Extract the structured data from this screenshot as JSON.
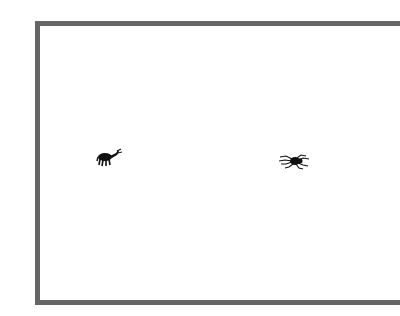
{
  "scene": {
    "frame": {
      "border_color": "#666666",
      "background": "#ffffff"
    },
    "creatures": [
      {
        "name": "ant-like insect",
        "icon": "insect-icon",
        "x": 96,
        "y": 148,
        "color": "#111111"
      },
      {
        "name": "spider",
        "icon": "spider-icon",
        "x": 279,
        "y": 153,
        "color": "#111111"
      }
    ]
  }
}
